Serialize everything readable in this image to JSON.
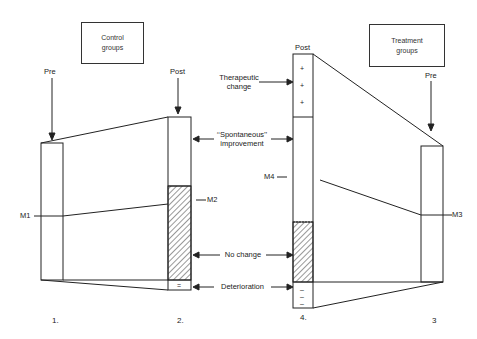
{
  "diagram": {
    "control_box": {
      "line1": "Control",
      "line2": "groups"
    },
    "treatment_box": {
      "line1": "Treatment",
      "line2": "groups"
    },
    "labels": {
      "control_pre": "Pre",
      "control_post": "Post",
      "treatment_post": "Post",
      "treatment_pre": "Pre",
      "therapeutic_change_1": "Therapeutic",
      "therapeutic_change_2": "change",
      "spontaneous_1": "‘‘Spontaneous’’",
      "spontaneous_2": "improvement",
      "no_change": "No  change",
      "deterioration": "Deterioration",
      "m1": "M1",
      "m2": "M2",
      "m3": "M3",
      "m4": "M4"
    },
    "bar_numbers": {
      "bar1": "1.",
      "bar2": "2.",
      "bar4": "4.",
      "bar3": "3"
    },
    "symbols": {
      "plus": "+",
      "minus": "–",
      "equals": "="
    },
    "colors": {
      "line": "#222222",
      "hatch": "#333333",
      "background": "#ffffff"
    }
  }
}
